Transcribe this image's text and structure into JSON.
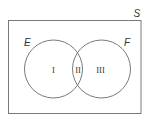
{
  "diagram": {
    "type": "venn",
    "universe": {
      "label": "S"
    },
    "sets": [
      {
        "label": "E"
      },
      {
        "label": "F"
      }
    ],
    "regions": [
      {
        "label": "I",
        "description": "E only"
      },
      {
        "label": "II",
        "description": "E and F"
      },
      {
        "label": "III",
        "description": "F only"
      }
    ],
    "colors": {
      "stroke": "#7a7a7a",
      "text": "#333333",
      "background": "#ffffff"
    }
  }
}
